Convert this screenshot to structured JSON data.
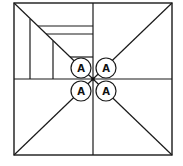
{
  "diagram": {
    "type": "geometric-square-division",
    "stroke_color": "#1a1a1a",
    "background": "#ffffff",
    "outer_square": {
      "x1": 14,
      "y1": 3,
      "x2": 172,
      "y2": 155
    },
    "center": {
      "x": 93,
      "y": 79
    },
    "labels": [
      {
        "text": "A",
        "cx": 81,
        "cy": 68,
        "r": 10
      },
      {
        "text": "A",
        "cx": 106,
        "cy": 68,
        "r": 10
      },
      {
        "text": "A",
        "cx": 81,
        "cy": 91,
        "r": 10
      },
      {
        "text": "A",
        "cx": 106,
        "cy": 91,
        "r": 10
      }
    ]
  }
}
